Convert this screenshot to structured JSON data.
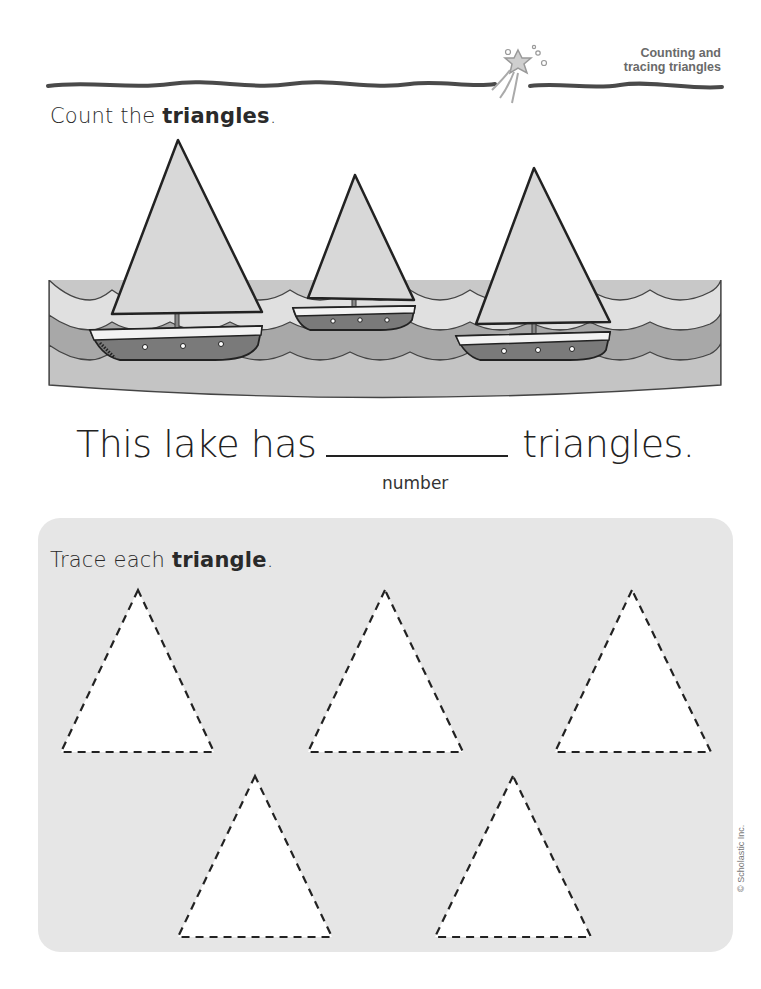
{
  "header": {
    "title_line1": "Counting and",
    "title_line2": "tracing triangles",
    "icon": "shooting-star-icon"
  },
  "count_section": {
    "instruction_prefix": "Count the ",
    "instruction_bold": "triangles",
    "instruction_suffix": ".",
    "scene": {
      "boats": 3,
      "sails": 3,
      "description": "Three sailboats with triangular sails on a wavy lake"
    },
    "sentence_prefix": "This lake has",
    "sentence_suffix": "triangles.",
    "answer_value": "",
    "answer_label": "number"
  },
  "trace_section": {
    "instruction_prefix": "Trace each ",
    "instruction_bold": "triangle",
    "instruction_suffix": ".",
    "triangle_count": 5
  },
  "footer": {
    "copyright": "© Scholastic Inc."
  },
  "colors": {
    "ink": "#222222",
    "sail": "#d8d8d8",
    "water_light": "#dcdcdc",
    "water_mid": "#a8a8a8",
    "water_deep": "#c4c4c4",
    "hull": "#7a7a7a",
    "panel": "#e6e6e6",
    "header_text": "#6a6a6a"
  }
}
